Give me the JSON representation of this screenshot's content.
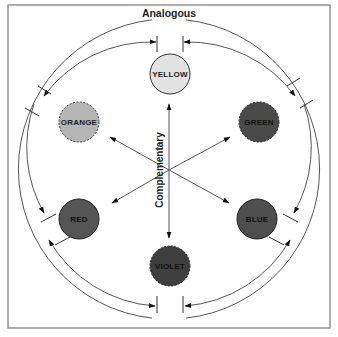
{
  "diagram": {
    "title": "Analogous",
    "axis_label": "Complementary",
    "frame": {
      "x": 8,
      "y": 5,
      "width": 322,
      "height": 323,
      "stroke": "#777777"
    },
    "center": {
      "x": 169,
      "y": 169
    },
    "outer_ring_radius": 150,
    "inner_ring_radius": 133,
    "nodes": [
      {
        "label": "YELLOW",
        "cx": 170,
        "cy": 74,
        "fill": "#e2e2e2",
        "border": "solid"
      },
      {
        "label": "ORANGE",
        "cx": 79,
        "cy": 122,
        "fill": "#b5b5b5",
        "border": "dashed"
      },
      {
        "label": "GREEN",
        "cx": 259,
        "cy": 122,
        "fill": "#4a4a4a",
        "border": "dashed"
      },
      {
        "label": "RED",
        "cx": 79,
        "cy": 219,
        "fill": "#555555",
        "border": "solid"
      },
      {
        "label": "BLUE",
        "cx": 257,
        "cy": 219,
        "fill": "#4e4e4e",
        "border": "solid"
      },
      {
        "label": "VIOLET",
        "cx": 170,
        "cy": 266,
        "fill": "#3f3f3f",
        "border": "dashed"
      }
    ],
    "colors": {
      "line": "#555555",
      "text": "#222222",
      "dark_text": "#111111"
    }
  }
}
